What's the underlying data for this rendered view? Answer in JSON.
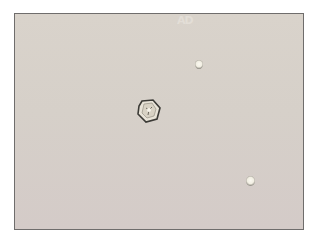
{
  "image": {
    "type": "brightfield micrograph",
    "description": "Microscope field with one hexagonal crystal and two small round refractile bodies on a pale beige background",
    "watermark": "AD",
    "background_color": "#d7d0c9",
    "border_color": "#6f6d6c",
    "objects": [
      {
        "name": "hexagonal-crystal",
        "shape": "hexagon",
        "x": 136,
        "y": 98,
        "w": 26,
        "h": 24
      },
      {
        "name": "round-body-top",
        "shape": "circle",
        "x": 194,
        "y": 59,
        "w": 8,
        "h": 9
      },
      {
        "name": "round-body-bottom",
        "shape": "circle",
        "x": 245,
        "y": 175,
        "w": 9,
        "h": 10
      }
    ]
  }
}
